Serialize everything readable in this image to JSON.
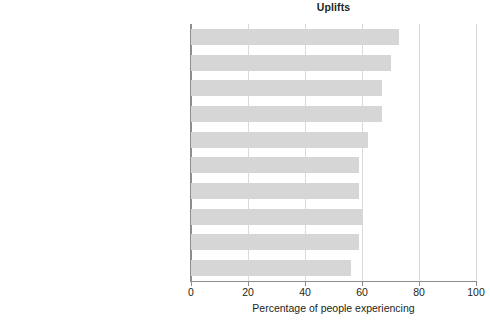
{
  "chart_data": {
    "type": "bar",
    "orientation": "horizontal",
    "title": "Uplifts",
    "xlabel": "Percentage of people experiencing",
    "ylabel": "",
    "xlim": [
      0,
      100
    ],
    "xticks": [
      0,
      20,
      40,
      60,
      80,
      100
    ],
    "xtick_labels": [
      "0",
      "20",
      "40",
      "60",
      "80",
      "100"
    ],
    "grid": "vertical",
    "legend": null,
    "bar_color": "#d6d6d6",
    "categories": [
      "Relating well with spouse or lover",
      "Relating well with friends",
      "Completing a task",
      "Feeling healthy",
      "Getting enough sleep",
      "Eating out",
      "Meeting responsibilities",
      "Visiting, phoning, or writing someone",
      "Spending time with family",
      "Home (inside) pleasing to you"
    ],
    "values": [
      73,
      70,
      67,
      67,
      62,
      59,
      59,
      60,
      59,
      56
    ]
  }
}
